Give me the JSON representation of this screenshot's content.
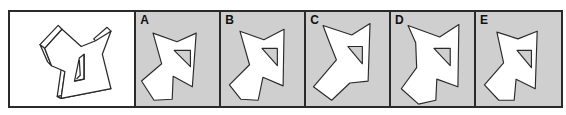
{
  "puzzle": {
    "type": "spatial-reasoning",
    "reference_panel": {
      "description": "3D extruded star-like polygon with triangular hole"
    },
    "options": [
      {
        "label": "A"
      },
      {
        "label": "B"
      },
      {
        "label": "C"
      },
      {
        "label": "D"
      },
      {
        "label": "E"
      }
    ],
    "colors": {
      "option_background": "#cfcfcf",
      "shape_fill": "#ffffff",
      "outline": "#2a2a2a"
    }
  }
}
